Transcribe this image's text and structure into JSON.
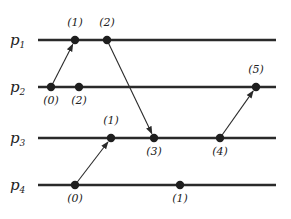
{
  "diagram": {
    "type": "space-time process diagram",
    "line_start_x": 38,
    "line_end_x": 276,
    "processes": [
      {
        "id": "p1",
        "name": "p",
        "sub": "1",
        "y": 40
      },
      {
        "id": "p2",
        "name": "p",
        "sub": "2",
        "y": 87
      },
      {
        "id": "p3",
        "name": "p",
        "sub": "3",
        "y": 138
      },
      {
        "id": "p4",
        "name": "p",
        "sub": "4",
        "y": 185
      }
    ],
    "events": [
      {
        "process": "p1",
        "x": 75,
        "label": "(1)",
        "label_pos": "above"
      },
      {
        "process": "p1",
        "x": 107,
        "label": "(2)",
        "label_pos": "above"
      },
      {
        "process": "p2",
        "x": 51,
        "label": "(0)",
        "label_pos": "below"
      },
      {
        "process": "p2",
        "x": 79,
        "label": "(2)",
        "label_pos": "below"
      },
      {
        "process": "p2",
        "x": 256,
        "label": "(5)",
        "label_pos": "above"
      },
      {
        "process": "p3",
        "x": 111,
        "label": "(1)",
        "label_pos": "above"
      },
      {
        "process": "p3",
        "x": 154,
        "label": "(3)",
        "label_pos": "below"
      },
      {
        "process": "p3",
        "x": 220,
        "label": "(4)",
        "label_pos": "below"
      },
      {
        "process": "p4",
        "x": 75,
        "label": "(0)",
        "label_pos": "below"
      },
      {
        "process": "p4",
        "x": 180,
        "label": "(1)",
        "label_pos": "below"
      }
    ],
    "messages": [
      {
        "from": {
          "process": "p2",
          "x": 51
        },
        "to": {
          "process": "p1",
          "x": 75
        }
      },
      {
        "from": {
          "process": "p1",
          "x": 107
        },
        "to": {
          "process": "p3",
          "x": 154
        }
      },
      {
        "from": {
          "process": "p4",
          "x": 75
        },
        "to": {
          "process": "p3",
          "x": 111
        }
      },
      {
        "from": {
          "process": "p3",
          "x": 220
        },
        "to": {
          "process": "p2",
          "x": 256
        }
      }
    ],
    "colors": {
      "line": "#2a2a2a",
      "dot": "#1e1e1e",
      "text": "#222222"
    }
  }
}
